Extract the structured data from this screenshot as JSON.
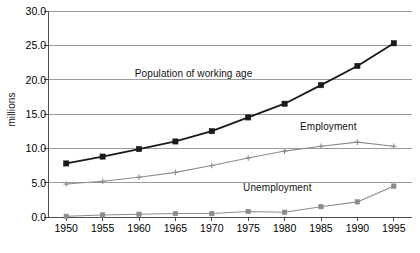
{
  "chart_data": {
    "type": "line",
    "title": "",
    "xlabel": "",
    "ylabel": "millions",
    "x": [
      1950,
      1955,
      1960,
      1965,
      1970,
      1975,
      1980,
      1985,
      1990,
      1995
    ],
    "xtick_labels": [
      "1950",
      "1955",
      "1960",
      "1965",
      "1970",
      "1975",
      "1980",
      "1985",
      "1990",
      "1995"
    ],
    "xlim": [
      1947.5,
      1997.5
    ],
    "ylim": [
      0,
      30
    ],
    "ytick_labels": [
      "0.0",
      "5.0",
      "10.0",
      "15.0",
      "20.0",
      "25.0",
      "30.0"
    ],
    "yticks": [
      0,
      5,
      10,
      15,
      20,
      25,
      30
    ],
    "grid": "horizontal",
    "legend": "inline-annotations",
    "series": [
      {
        "name": "Population of working age",
        "color": "#1a1a1a",
        "marker": "square",
        "values": [
          7.8,
          8.8,
          9.9,
          11.0,
          12.5,
          14.5,
          16.5,
          19.2,
          22.0,
          25.3
        ]
      },
      {
        "name": "Employment",
        "color": "#8c8c8c",
        "marker": "plus",
        "values": [
          4.8,
          5.2,
          5.8,
          6.5,
          7.5,
          8.6,
          9.6,
          10.3,
          10.9,
          10.3
        ]
      },
      {
        "name": "Unemployment",
        "color": "#8c8c8c",
        "marker": "square",
        "values": [
          0.1,
          0.3,
          0.4,
          0.5,
          0.5,
          0.8,
          0.7,
          1.5,
          2.2,
          4.5
        ]
      }
    ],
    "annotations": [
      {
        "text": "Population of working age",
        "x": 1967.5,
        "y": 21.0
      },
      {
        "text": "Employment",
        "x": 1986.0,
        "y": 13.2
      },
      {
        "text": "Unemployment",
        "x": 1979.0,
        "y": 4.3
      }
    ]
  },
  "axis": {
    "y_title": "millions"
  }
}
